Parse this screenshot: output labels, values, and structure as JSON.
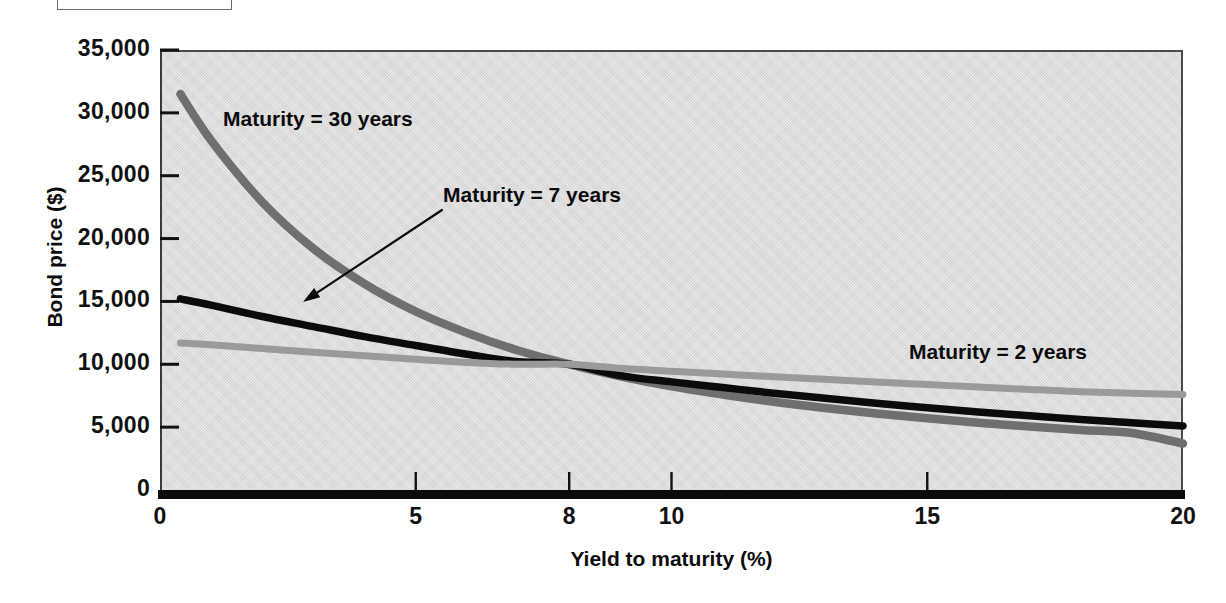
{
  "figure": {
    "caption_box_present": true
  },
  "chart_data": {
    "type": "line",
    "title": "",
    "xlabel": "Yield to maturity (%)",
    "ylabel": "Bond price ($)",
    "xlim": [
      0,
      20
    ],
    "ylim": [
      0,
      35000
    ],
    "grid": false,
    "legend_position": "inline-annotations",
    "x_ticks": [
      {
        "value": 0,
        "label": "0"
      },
      {
        "value": 5,
        "label": "5"
      },
      {
        "value": 8,
        "label": "8"
      },
      {
        "value": 10,
        "label": "10"
      },
      {
        "value": 15,
        "label": "15"
      },
      {
        "value": 20,
        "label": "20"
      }
    ],
    "y_ticks": [
      {
        "value": 35000,
        "label": "35,000"
      },
      {
        "value": 30000,
        "label": "30,000"
      },
      {
        "value": 25000,
        "label": "25,000"
      },
      {
        "value": 20000,
        "label": "20,000"
      },
      {
        "value": 15000,
        "label": "15,000"
      },
      {
        "value": 10000,
        "label": "10,000"
      },
      {
        "value": 5000,
        "label": "5,000"
      },
      {
        "value": 0,
        "label": "0"
      }
    ],
    "par_value": 10000,
    "coupon_rate_percent": 8,
    "crossover_point": {
      "x": 8,
      "y": 10000
    },
    "series": [
      {
        "name": "Maturity = 30 years",
        "color": "#6f6f6f",
        "annotation": "Maturity = 30 years",
        "x": [
          0.4,
          1,
          2,
          3,
          4,
          5,
          6,
          7,
          8,
          9,
          10,
          11,
          12,
          13,
          14,
          15,
          16,
          17,
          18,
          19,
          20
        ],
        "y": [
          31500,
          27800,
          22900,
          19200,
          16400,
          14200,
          12500,
          11100,
          10000,
          9050,
          8250,
          7600,
          7020,
          6520,
          6080,
          5700,
          5350,
          5050,
          4780,
          4540,
          3700
        ]
      },
      {
        "name": "Maturity = 7 years",
        "color": "#0b0b0b",
        "annotation": "Maturity = 7 years",
        "x": [
          0.4,
          1,
          2,
          3,
          4,
          5,
          6,
          7,
          8,
          9,
          10,
          11,
          12,
          13,
          14,
          15,
          16,
          17,
          18,
          19,
          20
        ],
        "y": [
          15200,
          14700,
          13800,
          13000,
          12200,
          11500,
          10800,
          10200,
          10000,
          9100,
          8600,
          8150,
          7700,
          7300,
          6900,
          6550,
          6200,
          5900,
          5600,
          5350,
          5100
        ]
      },
      {
        "name": "Maturity = 2 years",
        "color": "#9a9a9a",
        "annotation": "Maturity = 2 years",
        "x": [
          0.4,
          1,
          2,
          3,
          4,
          5,
          6,
          7,
          8,
          9,
          10,
          11,
          12,
          13,
          14,
          15,
          16,
          17,
          18,
          19,
          20
        ],
        "y": [
          11700,
          11550,
          11250,
          10950,
          10680,
          10400,
          10150,
          10000,
          10000,
          9680,
          9450,
          9230,
          9010,
          8800,
          8590,
          8390,
          8190,
          8000,
          7820,
          7700,
          7600
        ]
      }
    ],
    "annotation_arrow": {
      "label": "Maturity = 7 years",
      "from_x_px": 442,
      "from_y_px": 210,
      "to_x_px": 303,
      "to_y_px": 302
    }
  },
  "axes": {
    "x_title": "Yield to maturity (%)",
    "y_title": "Bond price ($)"
  }
}
